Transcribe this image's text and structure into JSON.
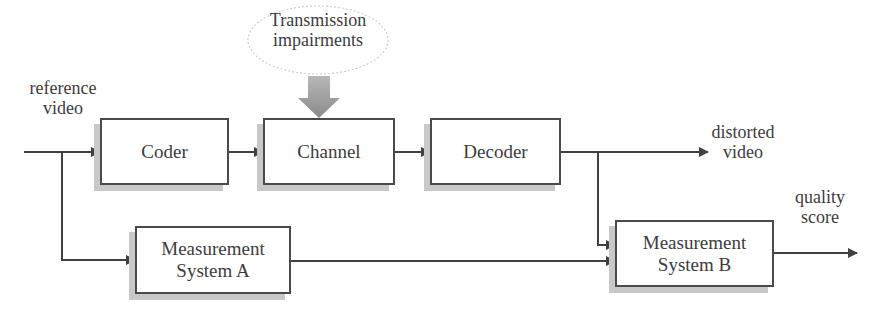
{
  "diagram": {
    "input_label": {
      "line1": "reference",
      "line2": "video"
    },
    "impairment": {
      "line1": "Transmission",
      "line2": "impairments"
    },
    "blocks": [
      {
        "id": "coder",
        "label": "Coder"
      },
      {
        "id": "channel",
        "label": "Channel"
      },
      {
        "id": "decoder",
        "label": "Decoder"
      },
      {
        "id": "meas_a",
        "line1": "Measurement",
        "line2": "System A"
      },
      {
        "id": "meas_b",
        "line1": "Measurement",
        "line2": "System B"
      }
    ],
    "outputs": {
      "distorted": {
        "line1": "distorted",
        "line2": "video"
      },
      "quality": {
        "line1": "quality",
        "line2": "score"
      }
    },
    "edges": [
      {
        "from": "reference video",
        "to": "coder"
      },
      {
        "from": "coder",
        "to": "channel"
      },
      {
        "from": "transmission impairments",
        "to": "channel"
      },
      {
        "from": "channel",
        "to": "decoder"
      },
      {
        "from": "decoder",
        "to": "distorted video"
      },
      {
        "from": "decoder",
        "to": "meas_b"
      },
      {
        "from": "reference video",
        "to": "meas_a"
      },
      {
        "from": "meas_a",
        "to": "meas_b"
      },
      {
        "from": "meas_b",
        "to": "quality score"
      }
    ],
    "colors": {
      "line": "#404040",
      "shadow": "#c8c8c8",
      "impairment_arrow": "#9a9a9a"
    }
  }
}
